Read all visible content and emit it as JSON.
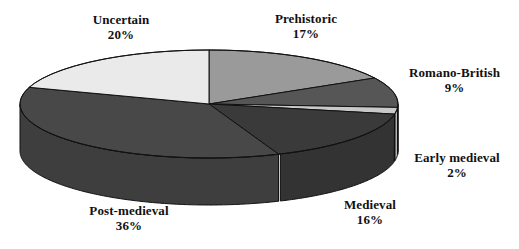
{
  "chart_data": {
    "type": "pie",
    "title": "",
    "subtitle": "",
    "xlabel": "",
    "ylabel": "",
    "legend_position": "none",
    "grid": false,
    "style": "3d-pie",
    "categories": [
      "Prehistoric",
      "Romano-British",
      "Early medieval",
      "Medieval",
      "Post-medieval",
      "Uncertain"
    ],
    "values": [
      17,
      9,
      2,
      16,
      36,
      20
    ],
    "value_unit": "%",
    "slices": [
      {
        "label": "Prehistoric",
        "value": 17,
        "value_text": "17%",
        "color": "#9a9a9a",
        "side_color": "#8a8a8a"
      },
      {
        "label": "Romano-British",
        "value": 9,
        "value_text": "9%",
        "color": "#565656",
        "side_color": "#4a4a4a"
      },
      {
        "label": "Early medieval",
        "value": 2,
        "value_text": "2%",
        "color": "#c9c9c9",
        "side_color": "#b3b3b3"
      },
      {
        "label": "Medieval",
        "value": 16,
        "value_text": "16%",
        "color": "#3a3a3a",
        "side_color": "#333333"
      },
      {
        "label": "Post-medieval",
        "value": 36,
        "value_text": "36%",
        "color": "#484848",
        "side_color": "#3e3e3e"
      },
      {
        "label": "Uncertain",
        "value": 20,
        "value_text": "20%",
        "color": "#eaeaea",
        "side_color": "#d2d2d2"
      }
    ],
    "colors": {
      "background": "#ffffff",
      "outline": "#111111",
      "text": "#111111"
    }
  },
  "labels": {
    "uncertain": {
      "name": "Uncertain",
      "value": "20%"
    },
    "prehistoric": {
      "name": "Prehistoric",
      "value": "17%"
    },
    "romano_british": {
      "name": "Romano-British",
      "value": "9%"
    },
    "early_medieval": {
      "name": "Early medieval",
      "value": "2%"
    },
    "medieval": {
      "name": "Medieval",
      "value": "16%"
    },
    "post_medieval": {
      "name": "Post-medieval",
      "value": "36%"
    }
  }
}
